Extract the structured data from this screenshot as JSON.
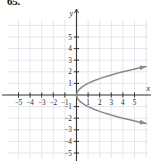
{
  "figure": {
    "problem_number": "65.",
    "caption": ""
  },
  "chart_data": {
    "type": "line",
    "title": "",
    "subtitle": "",
    "xlabel": "x",
    "ylabel": "y",
    "xlim": [
      -6.2,
      6.2
    ],
    "ylim": [
      -5.8,
      5.8
    ],
    "grid": true,
    "grid_color": "#d8dce4",
    "axis_color": "#3a3a3a",
    "curve_color": "#8a8a8a",
    "legend": "none",
    "x_ticks": [
      -5,
      -4,
      -3,
      -2,
      -1,
      1,
      2,
      3,
      4,
      5
    ],
    "y_ticks": [
      -5,
      -4,
      -3,
      -2,
      -1,
      1,
      2,
      3,
      4,
      5
    ],
    "x_tick_labels": [
      "-5",
      "-4",
      "-3",
      "-2",
      "-1",
      "1",
      "2",
      "3",
      "4",
      "5"
    ],
    "y_tick_labels": [
      "-5",
      "-4",
      "-3",
      "-2",
      "-1",
      "1",
      "2",
      "3",
      "4",
      "5"
    ],
    "axis_label_x": "x",
    "axis_label_y": "y",
    "series": [
      {
        "name": "upper-branch",
        "equation": "y = sqrt(x)",
        "arrow_end": true,
        "points": [
          [
            0,
            0
          ],
          [
            0.06,
            0.245
          ],
          [
            0.12,
            0.346
          ],
          [
            0.25,
            0.5
          ],
          [
            0.5,
            0.707
          ],
          [
            0.75,
            0.866
          ],
          [
            1,
            1
          ],
          [
            1.5,
            1.225
          ],
          [
            2,
            1.414
          ],
          [
            2.5,
            1.581
          ],
          [
            3,
            1.732
          ],
          [
            3.5,
            1.871
          ],
          [
            4,
            2
          ],
          [
            4.5,
            2.121
          ],
          [
            5,
            2.236
          ],
          [
            5.5,
            2.345
          ],
          [
            6,
            2.449
          ]
        ]
      },
      {
        "name": "lower-branch",
        "equation": "y = -sqrt(x)",
        "arrow_end": true,
        "points": [
          [
            0,
            0
          ],
          [
            0.06,
            -0.245
          ],
          [
            0.12,
            -0.346
          ],
          [
            0.25,
            -0.5
          ],
          [
            0.5,
            -0.707
          ],
          [
            0.75,
            -0.866
          ],
          [
            1,
            -1
          ],
          [
            1.5,
            -1.225
          ],
          [
            2,
            -1.414
          ],
          [
            2.5,
            -1.581
          ],
          [
            3,
            -1.732
          ],
          [
            3.5,
            -1.871
          ],
          [
            4,
            -2
          ],
          [
            4.5,
            -2.121
          ],
          [
            5,
            -2.236
          ],
          [
            5.5,
            -2.345
          ],
          [
            6,
            -2.449
          ]
        ]
      }
    ],
    "vertex": [
      0,
      0
    ],
    "opens": "right",
    "annotations": []
  }
}
